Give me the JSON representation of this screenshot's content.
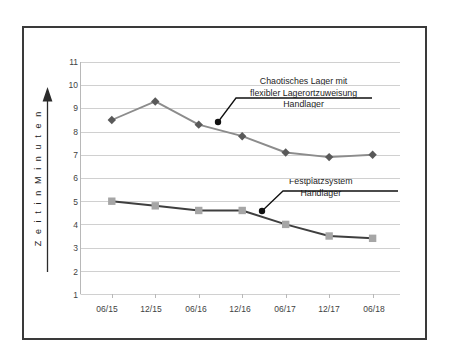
{
  "chart_data": {
    "type": "line",
    "title": "",
    "xlabel": "",
    "ylabel": "Z e i t   i n   M i n u t e n",
    "ylabel_plain": "Zeit in Minuten",
    "categories": [
      "06/15",
      "12/15",
      "06/16",
      "12/16",
      "06/17",
      "12/17",
      "06/18"
    ],
    "ylim": [
      1,
      11
    ],
    "yticks": [
      1,
      2,
      3,
      4,
      5,
      6,
      7,
      8,
      9,
      10,
      11
    ],
    "grid": true,
    "legend_position": "inline-annotations",
    "series": [
      {
        "name": "Chaotisches Lager mit flexibler Lagerortzuweisung Handlager",
        "values": [
          8.5,
          9.3,
          8.3,
          7.8,
          7.1,
          6.9,
          7.0
        ],
        "color": "#8c8c8c",
        "marker": "diamond",
        "marker_color": "#595959"
      },
      {
        "name": "Festplatzsystem Handlager",
        "values": [
          5.0,
          4.8,
          4.6,
          4.6,
          4.0,
          3.5,
          3.4
        ],
        "color": "#3f3f3f",
        "marker": "square",
        "marker_color": "#a6a6a6"
      }
    ],
    "annotations": [
      {
        "id": "chaotisches-lager",
        "lines": [
          "Chaotisches Lager mit",
          "flexibler Lagerortzuweisung",
          "Handlager"
        ],
        "anchor_value": 8.25,
        "anchor_x_index": 2.5
      },
      {
        "id": "festplatzsystem",
        "lines": [
          "Festplatzsystem",
          "Handlager"
        ],
        "anchor_value": 4.55,
        "anchor_x_index": 3.5
      }
    ]
  },
  "yticks_text": [
    "11",
    "10",
    "9",
    "8",
    "7",
    "6",
    "5",
    "4",
    "3",
    "2",
    "1"
  ],
  "xticks_text": [
    "06/15",
    "12/15",
    "06/16",
    "12/16",
    "06/17",
    "12/17",
    "06/18"
  ],
  "axis": {
    "y_title": "Z e i t   i n   M i n u t e n",
    "arrow_icon": "up-arrow-icon"
  },
  "annotation1": {
    "line1": "Chaotisches Lager mit",
    "line2": "flexibler Lagerortzuweisung",
    "line3": "Handlager"
  },
  "annotation2": {
    "line1": "Festplatzsystem",
    "line2": "Handlager"
  },
  "colors": {
    "frame": "#3a3a3a",
    "grid": "#d0d0d0",
    "series1": "#8c8c8c",
    "series1_marker": "#595959",
    "series2": "#3f3f3f",
    "series2_marker": "#a6a6a6",
    "leader": "#111111",
    "text": "#3f3f3f"
  }
}
